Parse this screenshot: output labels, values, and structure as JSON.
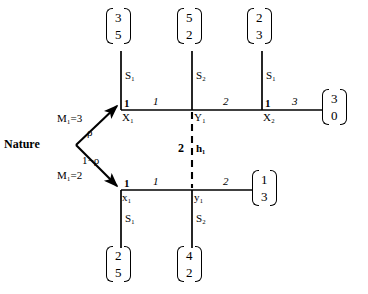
{
  "figure": {
    "name": "extensive-form-signaling-game-tree",
    "background_color": "#ffffff",
    "line_color": "#000000"
  },
  "nature": {
    "label": "Nature",
    "branches": [
      {
        "move": "M₁=3",
        "probability": "ρ"
      },
      {
        "move": "M₁=2",
        "probability": "1−ρ"
      }
    ]
  },
  "information_set": {
    "player": "2",
    "name": "h₁"
  },
  "top_branch": {
    "nodes": [
      {
        "player": "1",
        "name": "X₁"
      },
      {
        "player": "",
        "name": "Y₁"
      },
      {
        "player": "1",
        "name": "X₂"
      }
    ],
    "action_labels": [
      "1",
      "2",
      "3"
    ],
    "stop_labels": [
      "S₁",
      "S₂",
      "S₁"
    ],
    "stop_payoffs": [
      {
        "p1": "3",
        "p2": "5"
      },
      {
        "p1": "5",
        "p2": "2"
      },
      {
        "p1": "2",
        "p2": "3"
      }
    ],
    "terminal_payoff": {
      "p1": "3",
      "p2": "0"
    }
  },
  "bottom_branch": {
    "nodes": [
      {
        "player": "1",
        "name": "x₁"
      },
      {
        "player": "",
        "name": "y₁"
      }
    ],
    "action_labels": [
      "1",
      "2"
    ],
    "stop_labels": [
      "S₁",
      "S₂"
    ],
    "stop_payoffs": [
      {
        "p1": "2",
        "p2": "5"
      },
      {
        "p1": "4",
        "p2": "2"
      }
    ],
    "terminal_payoff": {
      "p1": "1",
      "p2": "3"
    }
  }
}
